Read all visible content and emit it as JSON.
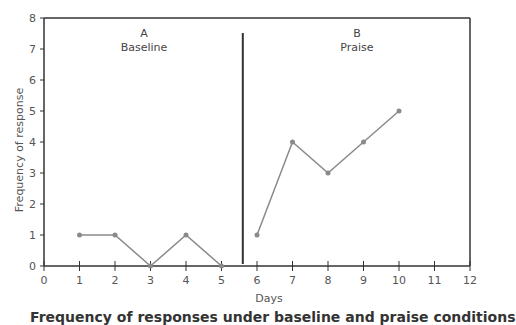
{
  "chart_data": {
    "type": "line",
    "title": "",
    "xlabel": "Days",
    "ylabel": "Frequency of response",
    "xlim": [
      0,
      12
    ],
    "ylim": [
      0,
      8
    ],
    "x_ticks": [
      0,
      1,
      2,
      3,
      4,
      5,
      6,
      7,
      8,
      9,
      10,
      11,
      12
    ],
    "y_ticks": [
      0,
      1,
      2,
      3,
      4,
      5,
      6,
      7,
      8
    ],
    "grid": false,
    "legend": null,
    "phase_change_line_x": 5.6,
    "phases": [
      {
        "letter": "A",
        "name": "Baseline",
        "x": [
          1,
          2,
          3,
          4,
          5
        ],
        "values": [
          1,
          1,
          0,
          1,
          0
        ]
      },
      {
        "letter": "B",
        "name": "Praise",
        "x": [
          6,
          7,
          8,
          9,
          10
        ],
        "values": [
          1,
          4,
          3,
          4,
          5
        ]
      }
    ],
    "series": [
      {
        "name": "Baseline",
        "x": [
          1,
          2,
          3,
          4,
          5
        ],
        "values": [
          1,
          1,
          0,
          1,
          0
        ]
      },
      {
        "name": "Praise",
        "x": [
          6,
          7,
          8,
          9,
          10
        ],
        "values": [
          1,
          4,
          3,
          4,
          5
        ]
      }
    ],
    "colors": {
      "line": "#8a8a8a",
      "marker": "#8a8a8a",
      "axis": "#333333",
      "text": "#555555"
    }
  },
  "caption": "Frequency of responses under baseline and praise conditions"
}
